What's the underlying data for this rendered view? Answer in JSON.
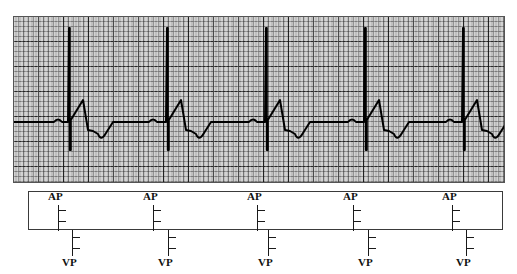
{
  "figure": {
    "kind": "ecg-with-marker-channel"
  },
  "ecg_strip": {
    "paper_color": "#c9c9c9",
    "grid_minor_color": "#3c3c3c",
    "grid_major_color": "#141414",
    "trace_color": "#000000",
    "minor_square_px": 5,
    "major_square_px": 25,
    "baseline_y": 106,
    "beat_count": 5
  },
  "marker_channel": {
    "box_color": "#3a3a3a",
    "marker_color": "#1a1a1a",
    "atrial_label": "AP",
    "ventricular_label": "VP",
    "atrial_markers": [
      {
        "label": "AP",
        "x": 58
      },
      {
        "label": "AP",
        "x": 153
      },
      {
        "label": "AP",
        "x": 257
      },
      {
        "label": "AP",
        "x": 353
      },
      {
        "label": "AP",
        "x": 452
      }
    ],
    "ventricular_markers": [
      {
        "label": "VP",
        "x": 72
      },
      {
        "label": "VP",
        "x": 168
      },
      {
        "label": "VP",
        "x": 268
      },
      {
        "label": "VP",
        "x": 368
      },
      {
        "label": "VP",
        "x": 466
      }
    ]
  },
  "chart_data": {
    "type": "line",
    "title": "",
    "xlabel": "",
    "ylabel": "",
    "series": [
      {
        "name": "Surface ECG",
        "comment": "Atrial-paced, ventricular-paced beats: small atrial pacing artifact, P wave, ventricular pacing spike, wide paced QRS, negative T wave",
        "beats": [
          {
            "index": 1,
            "atrial_spike_x": 45,
            "p_wave_x": 50,
            "vent_spike_x": 56,
            "r_peak_x": 70,
            "t_trough_x": 88
          },
          {
            "index": 2,
            "atrial_spike_x": 140,
            "p_wave_x": 146,
            "vent_spike_x": 154,
            "r_peak_x": 168,
            "t_trough_x": 186
          },
          {
            "index": 3,
            "atrial_spike_x": 240,
            "p_wave_x": 246,
            "vent_spike_x": 253,
            "r_peak_x": 267,
            "t_trough_x": 285
          },
          {
            "index": 4,
            "atrial_spike_x": 339,
            "p_wave_x": 345,
            "vent_spike_x": 352,
            "r_peak_x": 366,
            "t_trough_x": 384
          },
          {
            "index": 5,
            "atrial_spike_x": 437,
            "p_wave_x": 443,
            "vent_spike_x": 450,
            "r_peak_x": 464,
            "t_trough_x": 482
          }
        ],
        "baseline_mv": 0,
        "r_peak_mv": 0.9,
        "t_trough_mv": -0.72,
        "pacing_spike_top_mv": 3.5,
        "pacing_spike_bottom_mv": -1.1
      }
    ],
    "grid": true,
    "legend": "none"
  }
}
